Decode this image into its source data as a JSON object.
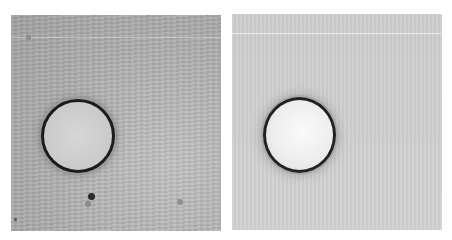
{
  "figure": {
    "panels": [
      {
        "id": "left",
        "description": "Brightfield micrograph of a circular droplet on a textured grey background",
        "background_color": "#a9a9a9",
        "droplet": {
          "center": [
            78,
            136
          ],
          "radius": 37,
          "rim_color": "#1c1c1c",
          "fill_color": "#cfcfcf"
        },
        "specks": [
          {
            "x": 90,
            "y": 196,
            "r": 3,
            "color": "#2a2a2a"
          },
          {
            "x": 87,
            "y": 203,
            "r": 3,
            "color": "#8a8a8a"
          },
          {
            "x": 180,
            "y": 201,
            "r": 3,
            "color": "#8f8f8f"
          },
          {
            "x": 15,
            "y": 219,
            "r": 1.5,
            "color": "#555555"
          },
          {
            "x": 28,
            "y": 37,
            "r": 2,
            "color": "#8d8d8d"
          }
        ]
      },
      {
        "id": "right",
        "description": "Processed / background-corrected micrograph of the same droplet on a smooth light grey background",
        "background_color": "#cfcfcf",
        "droplet": {
          "center": [
            299,
            133
          ],
          "radius": 37,
          "rim_color": "#222222",
          "fill_color": "#f2f2f2"
        },
        "specks": []
      }
    ]
  }
}
